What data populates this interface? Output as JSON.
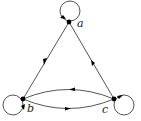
{
  "diagram": {
    "type": "directed-graph",
    "nodes": [
      {
        "id": "a",
        "label": "a",
        "x": 69,
        "y": 22,
        "self_loop": true
      },
      {
        "id": "b",
        "label": "b",
        "x": 23,
        "y": 99,
        "self_loop": true
      },
      {
        "id": "c",
        "label": "c",
        "x": 114,
        "y": 99,
        "self_loop": true
      }
    ],
    "edges": [
      {
        "from": "a",
        "to": "a",
        "kind": "loop"
      },
      {
        "from": "b",
        "to": "b",
        "kind": "loop"
      },
      {
        "from": "c",
        "to": "c",
        "kind": "loop"
      },
      {
        "from": "a",
        "to": "b",
        "kind": "straight"
      },
      {
        "from": "c",
        "to": "a",
        "kind": "straight"
      },
      {
        "from": "c",
        "to": "b",
        "kind": "curved-upper"
      },
      {
        "from": "b",
        "to": "c",
        "kind": "curved-lower"
      }
    ],
    "colors": {
      "stroke": "#555555",
      "node": "#000000",
      "label": "#222222"
    }
  }
}
